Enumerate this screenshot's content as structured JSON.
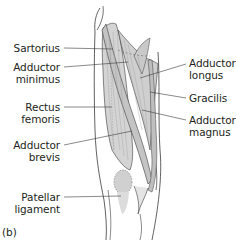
{
  "figure": {
    "panel_label": "(b)",
    "colors": {
      "muscle_fill": "#d9d9d9",
      "muscle_shade": "#bdbdbd",
      "outline": "#3a3a3a",
      "leader": "#3a3a3a",
      "text": "#231f20",
      "background": "#ffffff"
    }
  },
  "labels": {
    "left": [
      {
        "name": "sartorius",
        "lines": [
          "Sartorius"
        ]
      },
      {
        "name": "adductor-minimus",
        "lines": [
          "Adductor",
          "minimus"
        ]
      },
      {
        "name": "rectus-femoris",
        "lines": [
          "Rectus",
          "femoris"
        ]
      },
      {
        "name": "adductor-brevis",
        "lines": [
          "Adductor",
          "brevis"
        ]
      },
      {
        "name": "patellar-ligament",
        "lines": [
          "Patellar",
          "ligament"
        ]
      }
    ],
    "right": [
      {
        "name": "adductor-longus",
        "lines": [
          "Adductor",
          "longus"
        ]
      },
      {
        "name": "gracilis",
        "lines": [
          "Gracilis"
        ]
      },
      {
        "name": "adductor-magnus",
        "lines": [
          "Adductor",
          "magnus"
        ]
      }
    ]
  }
}
